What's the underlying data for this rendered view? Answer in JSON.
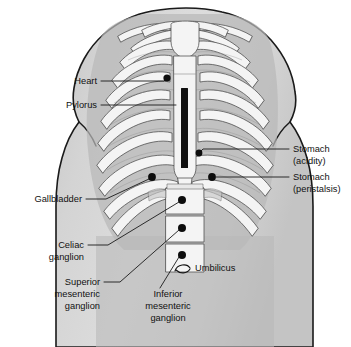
{
  "figure": {
    "background_color": "#ffffff",
    "torso_fill_color": "#d2d2d2",
    "cavity_fill_color": "#b9b9b9",
    "bone_fill_color": "#f4f4f4",
    "outline_color": "#1a1a1a",
    "marker_color": "#0d0d0d",
    "sternum_bar_color": "#0f0f0f"
  },
  "labels": {
    "heart": {
      "lines": [
        "Heart"
      ],
      "text_x": 97,
      "text_y": 84,
      "align": "end",
      "marker_x": 167,
      "marker_y": 78,
      "marker_r": 3.6,
      "leader": "M 101,81 L 164,81 L 167,78"
    },
    "pylorus": {
      "lines": [
        "Pylorus"
      ],
      "text_x": 97,
      "text_y": 108,
      "align": "end",
      "marker_x": 177,
      "marker_y": 105,
      "marker_r": 0,
      "leader": "M 101,105 L 176,105"
    },
    "stomach_acidity": {
      "lines": [
        "Stomach",
        "(acidity)"
      ],
      "text_x": 293,
      "text_y": 152,
      "align": "start",
      "marker_x": 199,
      "marker_y": 153,
      "marker_r": 3.4,
      "leader": "M 289,149 L 203,149 L 199,153"
    },
    "stomach_peristalsis": {
      "lines": [
        "Stomach",
        "(peristalsis)"
      ],
      "text_x": 293,
      "text_y": 180,
      "align": "start",
      "marker_x": 212,
      "marker_y": 177,
      "marker_r": 3.9,
      "leader": "M 289,177 L 216,177"
    },
    "gallbladder": {
      "lines": [
        "Gallbladder"
      ],
      "text_x": 82,
      "text_y": 202,
      "align": "end",
      "marker_x": 152,
      "marker_y": 177,
      "marker_r": 3.9,
      "leader": "M 86,199 L 106,199 L 149,179"
    },
    "celiac_ganglion": {
      "lines": [
        "Celiac",
        "ganglion"
      ],
      "text_x": 84,
      "text_y": 248,
      "align": "end",
      "marker_x": 182,
      "marker_y": 200,
      "marker_r": 4.0,
      "leader": "M 88,245 L 108,245 L 179,202"
    },
    "superior_mesenteric_ganglion": {
      "lines": [
        "Superior",
        "mesenteric",
        "ganglion"
      ],
      "text_x": 100,
      "text_y": 285,
      "align": "end",
      "marker_x": 182,
      "marker_y": 228,
      "marker_r": 4.0,
      "leader": "M 104,282 L 120,282 L 179,230"
    },
    "inferior_mesenteric_ganglion": {
      "lines": [
        "Inferior",
        "mesenteric",
        "ganglion"
      ],
      "text_x": 168,
      "text_y": 297,
      "align": "mid",
      "marker_x": 182,
      "marker_y": 255,
      "marker_r": 4.0,
      "leader": "M 160,288 L 179,257"
    },
    "umbilicus": {
      "lines": [
        "Umbilicus"
      ],
      "text_x": 195,
      "text_y": 271,
      "align": "start",
      "marker_x": 182,
      "marker_y": 268,
      "marker_r": 0,
      "leader": ""
    }
  },
  "structures": {
    "sternum_label": "sternum",
    "vertebrae_count": 3,
    "rib_pairs": 8
  }
}
